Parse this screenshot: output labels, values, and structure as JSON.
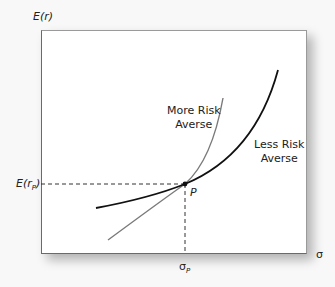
{
  "diagram": {
    "title": "",
    "y_axis_label": "E(r)",
    "x_axis_label": "σ",
    "y_point_label_main": "E(r",
    "y_point_label_sub": "P",
    "y_point_label_close": ")",
    "x_point_label_main": "σ",
    "x_point_label_sub": "P",
    "point_label": "P",
    "curves": [
      {
        "name": "More Risk Averse",
        "label_line1": "More Risk",
        "label_line2": "Averse",
        "color": "#777777"
      },
      {
        "name": "Less Risk Averse",
        "label_line1": "Less Risk",
        "label_line2": "Averse",
        "color": "#111111"
      }
    ],
    "colors": {
      "background": "#f8f8f8",
      "plot_background": "#ffffff",
      "axis": "#6a6a6a",
      "dashed_guides": "#333333"
    }
  }
}
